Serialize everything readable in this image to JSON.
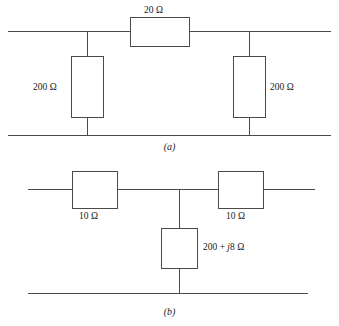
{
  "figure": {
    "line_color": "#4a4a4a",
    "box_fill": "#ffffff",
    "background": "#ffffff"
  },
  "diagram_a": {
    "caption": "(a)",
    "series_resistor": {
      "label": "20 Ω",
      "value": 20,
      "unit": "Ω",
      "orientation": "horizontal"
    },
    "shunt_resistor_left": {
      "label": "200 Ω",
      "value": 200,
      "unit": "Ω",
      "orientation": "vertical"
    },
    "shunt_resistor_right": {
      "label": "200 Ω",
      "value": 200,
      "unit": "Ω",
      "orientation": "vertical"
    }
  },
  "diagram_b": {
    "caption": "(b)",
    "series_resistor_left": {
      "label": "10 Ω",
      "value": 10,
      "unit": "Ω",
      "orientation": "horizontal"
    },
    "series_resistor_right": {
      "label": "10 Ω",
      "value": 10,
      "unit": "Ω",
      "orientation": "horizontal"
    },
    "shunt_impedance": {
      "label_real": "200 + ",
      "label_imag_symbol": "j",
      "label_imag_value": "8 Ω",
      "label_full": "200 + j8 Ω",
      "real": 200,
      "imag": 8,
      "unit": "Ω",
      "orientation": "vertical"
    }
  }
}
